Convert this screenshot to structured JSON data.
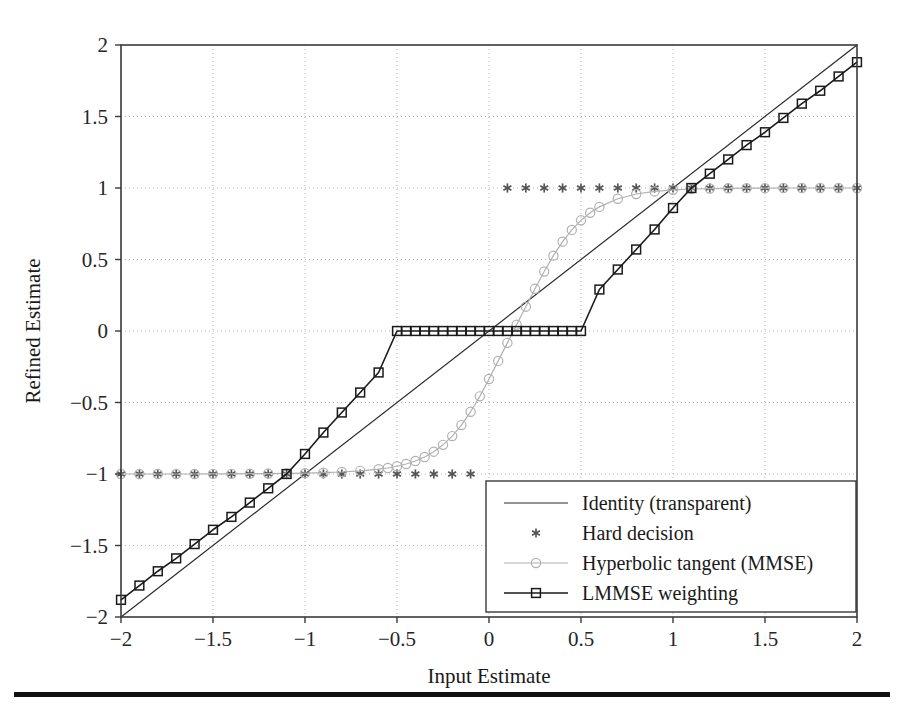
{
  "figure": {
    "background_color": "#ffffff",
    "frame_color": "#3a3a3a",
    "grid_color": "#b4b4b4",
    "bottom_rule_color": "#111111"
  },
  "chart_data": {
    "type": "line",
    "title": "",
    "xlabel": "Input Estimate",
    "ylabel": "Refined Estimate",
    "xlim": [
      -2,
      2
    ],
    "ylim": [
      -2,
      2
    ],
    "xticks": [
      -2,
      -1.5,
      -1,
      -0.5,
      0,
      0.5,
      1,
      1.5,
      2
    ],
    "xticklabels": [
      "-2",
      "-1.5",
      "-1",
      "-0.5",
      "0",
      "0.5",
      "1",
      "1.5",
      "2"
    ],
    "yticks": [
      -2,
      -1.5,
      -1,
      -0.5,
      0,
      0.5,
      1,
      1.5,
      2
    ],
    "yticklabels": [
      "-2",
      "-1.5",
      "-1",
      "-0.5",
      "0",
      "0.5",
      "1",
      "1.5",
      "2"
    ],
    "grid": true,
    "grid_style": "dotted",
    "legend_position": "lower right",
    "series": [
      {
        "name": "Identity (transparent)",
        "style": "line",
        "color": "#2b2b2b",
        "marker": "none",
        "linewidth": 1.2,
        "x": [
          -2,
          2
        ],
        "y": [
          -2,
          2
        ]
      },
      {
        "name": "Hard decision",
        "style": "markers",
        "color": "#555555",
        "marker": "asterisk",
        "linewidth": 0,
        "x": [
          -2,
          -1.9,
          -1.8,
          -1.7,
          -1.6,
          -1.5,
          -1.4,
          -1.3,
          -1.2,
          -1.1,
          -1,
          -0.9,
          -0.8,
          -0.7,
          -0.6,
          -0.5,
          -0.4,
          -0.3,
          -0.2,
          -0.1,
          0.1,
          0.2,
          0.3,
          0.4,
          0.5,
          0.6,
          0.7,
          0.8,
          0.9,
          1,
          1.1,
          1.2,
          1.3,
          1.4,
          1.5,
          1.6,
          1.7,
          1.8,
          1.9,
          2
        ],
        "y": [
          -1,
          -1,
          -1,
          -1,
          -1,
          -1,
          -1,
          -1,
          -1,
          -1,
          -1,
          -1,
          -1,
          -1,
          -1,
          -1,
          -1,
          -1,
          -1,
          -1,
          1,
          1,
          1,
          1,
          1,
          1,
          1,
          1,
          1,
          1,
          1,
          1,
          1,
          1,
          1,
          1,
          1,
          1,
          1,
          1
        ]
      },
      {
        "name": "Hyperbolic tangent (MMSE)",
        "style": "line+markers",
        "color": "#b0b0b0",
        "marker": "circle",
        "linewidth": 1.2,
        "x": [
          -2,
          -1.9,
          -1.8,
          -1.7,
          -1.6,
          -1.5,
          -1.4,
          -1.3,
          -1.2,
          -1.1,
          -1,
          -0.9,
          -0.8,
          -0.7,
          -0.6,
          -0.55,
          -0.5,
          -0.45,
          -0.4,
          -0.35,
          -0.3,
          -0.25,
          -0.2,
          -0.15,
          -0.1,
          -0.05,
          0,
          0.05,
          0.1,
          0.15,
          0.2,
          0.25,
          0.3,
          0.35,
          0.4,
          0.45,
          0.5,
          0.55,
          0.6,
          0.7,
          0.8,
          0.9,
          1,
          1.1,
          1.2,
          1.3,
          1.4,
          1.5,
          1.6,
          1.7,
          1.8,
          1.9,
          2
        ],
        "y": [
          -1,
          -1,
          -1,
          -1,
          -1,
          -0.999,
          -0.999,
          -0.998,
          -0.997,
          -0.996,
          -0.994,
          -0.991,
          -0.986,
          -0.978,
          -0.966,
          -0.958,
          -0.946,
          -0.93,
          -0.909,
          -0.881,
          -0.844,
          -0.796,
          -0.735,
          -0.658,
          -0.565,
          -0.457,
          -0.336,
          -0.209,
          -0.083,
          0.044,
          0.17,
          0.295,
          0.416,
          0.527,
          0.625,
          0.707,
          0.774,
          0.827,
          0.868,
          0.925,
          0.958,
          0.976,
          0.987,
          0.993,
          0.996,
          0.998,
          0.999,
          0.999,
          1,
          1,
          1,
          1,
          1
        ]
      },
      {
        "name": "LMMSE weighting",
        "style": "line+markers",
        "color": "#1a1a1a",
        "marker": "square",
        "linewidth": 1.6,
        "x": [
          -2,
          -1.9,
          -1.8,
          -1.7,
          -1.6,
          -1.5,
          -1.4,
          -1.3,
          -1.2,
          -1.1,
          -1,
          -0.9,
          -0.8,
          -0.7,
          -0.6,
          -0.5,
          -0.45,
          -0.4,
          -0.35,
          -0.3,
          -0.25,
          -0.2,
          -0.15,
          -0.1,
          -0.05,
          0,
          0.05,
          0.1,
          0.15,
          0.2,
          0.25,
          0.3,
          0.35,
          0.4,
          0.45,
          0.5,
          0.6,
          0.7,
          0.8,
          0.9,
          1,
          1.1,
          1.2,
          1.3,
          1.4,
          1.5,
          1.6,
          1.7,
          1.8,
          1.9,
          2
        ],
        "y": [
          -1.88,
          -1.78,
          -1.68,
          -1.59,
          -1.49,
          -1.39,
          -1.3,
          -1.2,
          -1.1,
          -1.0,
          -0.86,
          -0.71,
          -0.57,
          -0.43,
          -0.29,
          0,
          0,
          0,
          0,
          0,
          0,
          0,
          0,
          0,
          0,
          0,
          0,
          0,
          0,
          0,
          0,
          0,
          0,
          0,
          0,
          0,
          0.29,
          0.43,
          0.57,
          0.71,
          0.86,
          1.0,
          1.1,
          1.2,
          1.3,
          1.39,
          1.49,
          1.59,
          1.68,
          1.78,
          1.88
        ]
      }
    ]
  },
  "legend": {
    "entries": [
      {
        "label": "Identity (transparent)",
        "marker": "none",
        "color": "#2b2b2b"
      },
      {
        "label": "Hard decision",
        "marker": "asterisk",
        "color": "#555555"
      },
      {
        "label": "Hyperbolic tangent (MMSE)",
        "marker": "circle",
        "color": "#b0b0b0"
      },
      {
        "label": "LMMSE weighting",
        "marker": "square",
        "color": "#1a1a1a"
      }
    ]
  }
}
